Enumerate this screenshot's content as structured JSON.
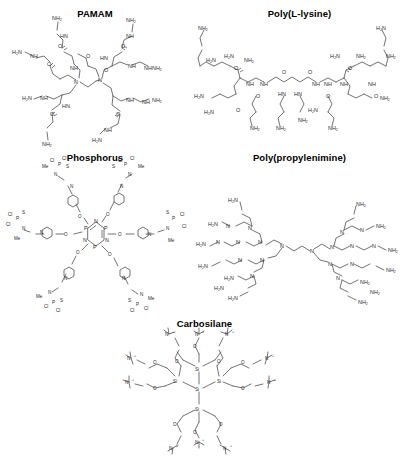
{
  "figure": {
    "type": "chemical-structure-panel-set",
    "background": "#ffffff",
    "line_color": "#5a5a5a",
    "label_color": "#2b2b2b",
    "panel_count": 5,
    "layout": "2 columns x 2 rows plus 1 centered bottom row"
  },
  "panels": [
    {
      "id": "pamam",
      "title": "PAMAM",
      "full_name": "polyamidoamine dendrimer",
      "core": "ethylenediamine",
      "branch_unit": "amide-amine (CONH-CH2CH2-N)",
      "terminal_group": "NH2",
      "terminal_count": 8,
      "atom_labels": [
        "H2N",
        "NH2",
        "NH",
        "HN",
        "N",
        "O"
      ]
    },
    {
      "id": "poly-l-lysine",
      "title": "Poly(L-lysine)",
      "full_name": "poly(L-lysine) dendrimer",
      "core": "hexane-1,6-diamine linker",
      "branch_unit": "L-lysine residue",
      "terminal_group": "NH2",
      "terminal_count": 8,
      "atom_labels": [
        "H2N",
        "NH2",
        "NH",
        "HN",
        "O"
      ]
    },
    {
      "id": "phosphorus",
      "title": "Phosphorus",
      "full_name": "phosphorus dendrimer",
      "core": "cyclotriphosphazene N3P3",
      "branch_unit": "4-oxybenzaldehyde hydrazone",
      "terminal_group": "N(Me)-P(S)Cl2",
      "terminal_count": 6,
      "atom_labels": [
        "P",
        "N",
        "O",
        "S",
        "Cl",
        "Me"
      ]
    },
    {
      "id": "poly-propylenimine",
      "title": "Poly(propylenimine)",
      "full_name": "poly(propylene imine) dendrimer",
      "core": "1,4-diaminobutane",
      "branch_unit": "propylene imine (CH2CH2CH2-N)",
      "terminal_group": "NH2",
      "terminal_count": 16,
      "atom_labels": [
        "H2N",
        "NH2",
        "N"
      ]
    },
    {
      "id": "carbosilane",
      "title": "Carbosilane",
      "full_name": "carbosilane dendrimer",
      "core": "tetra-substituted silicon",
      "branch_unit": "Si-(CH2)n-O ester linkage",
      "terminal_group": "quaternary ammonium N+",
      "terminal_count": 12,
      "atom_labels": [
        "Si",
        "O",
        "N+"
      ]
    }
  ]
}
